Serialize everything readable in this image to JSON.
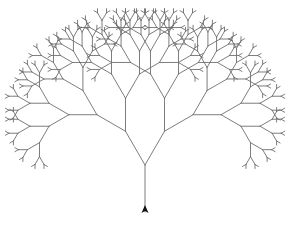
{
  "canvas": {
    "width": 288,
    "height": 230,
    "background": "#ffffff"
  },
  "tree": {
    "origin": {
      "x": 145,
      "y": 212
    },
    "start_heading_deg": 90,
    "branch_angle_deg": 30,
    "segment_lengths": [
      47,
      39,
      33,
      28,
      23,
      19,
      14,
      9,
      4
    ],
    "line_color": "#6e6e6e",
    "line_width": 0.9
  },
  "turtle": {
    "icon": "turtle-arrow-icon",
    "x": 145,
    "y": 212,
    "heading_deg": 90,
    "color": "#111111"
  }
}
